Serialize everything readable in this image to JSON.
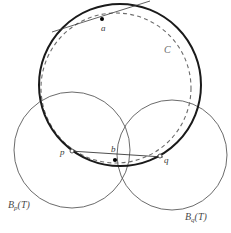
{
  "figure": {
    "type": "geometry-diagram",
    "background_color": "#ffffff",
    "width": 231,
    "height": 233,
    "labels": {
      "point_a": "a",
      "point_b": "b",
      "point_p": "p",
      "point_q": "q",
      "circle_C": "C",
      "ball_p_prefix": "B",
      "ball_p_sub": "p",
      "ball_p_arg": "(T)",
      "ball_q_prefix": "B",
      "ball_q_sub": "q",
      "ball_q_arg": "(T)",
      "ball_p_full": "Bp(T)",
      "ball_q_full": "Bq(T)"
    },
    "colors": {
      "bold_circle": "#1a1a1a",
      "dashed_circle": "#6b6b6b",
      "thin_circle": "#5a5a5a",
      "line": "#3a3a3a",
      "marker_fill": "#000000",
      "marker_open_fill": "#ffffff",
      "label_text": "#2b2b2b"
    },
    "shapes": {
      "circle_C": {
        "cx": 120,
        "cy": 85,
        "r": 81,
        "stroke_width": 2.0,
        "style": "solid"
      },
      "circle_dashed": {
        "cx": 116,
        "cy": 88,
        "r": 75,
        "stroke_width": 1.1,
        "style": "dashed"
      },
      "circle_Bp": {
        "cx": 72,
        "cy": 150,
        "r": 58,
        "stroke_width": 0.9,
        "style": "solid"
      },
      "circle_Bq": {
        "cx": 172,
        "cy": 155,
        "r": 55,
        "stroke_width": 0.9,
        "style": "solid"
      }
    },
    "points": {
      "a": {
        "x": 102,
        "y": 19,
        "marker": "filled"
      },
      "b": {
        "x": 115,
        "y": 160,
        "marker": "filled"
      },
      "p": {
        "x": 72,
        "y": 151,
        "marker": "open"
      },
      "q": {
        "x": 160,
        "y": 156,
        "marker": "open"
      }
    },
    "segments": {
      "p_to_q": {
        "x1": 72,
        "y1": 151,
        "x2": 160,
        "y2": 156
      },
      "a_through": {
        "x1": 53,
        "y1": 31,
        "x2": 148,
        "y2": 2
      }
    }
  }
}
